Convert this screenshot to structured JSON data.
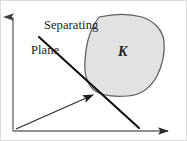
{
  "figure": {
    "type": "geometric-diagram",
    "width": 187,
    "height": 141,
    "background_color": "#ffffff"
  },
  "labels": {
    "separating_plane": {
      "line1": "Separating",
      "line2": "Plane"
    },
    "set_k": "K"
  },
  "colors": {
    "axis": "#555555",
    "blob_fill": "#e2e2e2",
    "blob_stroke": "#5a5a5a",
    "separating_line": "#111111",
    "vector_arrow": "#3a3a3a",
    "text": "#1a1a1a",
    "frame": "#d5d5d5"
  },
  "geometry": {
    "origin": {
      "x": 13,
      "y": 131
    },
    "y_axis": {
      "x1": 13,
      "y1": 131,
      "x2": 13,
      "y2": 14,
      "arrowhead": "up"
    },
    "x_axis": {
      "x1": 13,
      "y1": 131,
      "x2": 171,
      "y2": 131,
      "arrowhead": "right"
    },
    "separating_line": {
      "x1": 39,
      "y1": 37,
      "x2": 139,
      "y2": 128
    },
    "normal_vector": {
      "x1": 16,
      "y1": 129,
      "x2": 96,
      "y2": 92,
      "arrowhead": "tip"
    },
    "intersection_point": {
      "x": 97,
      "y": 93
    },
    "blob_path": "M 99,17 C 112,14 128,13 142,17 C 154,21 163,30 164,42 C 165,54 162,66 157,76 C 151,87 141,95 128,96 C 114,97 101,96 94,90 C 86,83 84,72 85,60 C 86,47 88,32 99,17 Z"
  },
  "legend": {
    "items": [
      {
        "name": "separating-plane",
        "label": "Separating Plane"
      },
      {
        "name": "convex-set",
        "label": "K"
      }
    ]
  }
}
